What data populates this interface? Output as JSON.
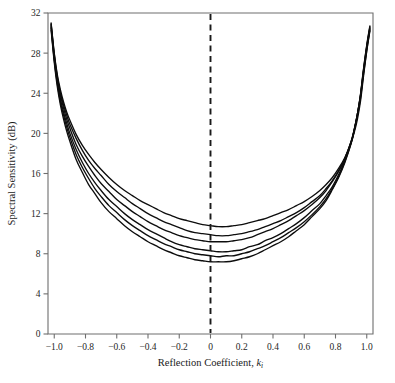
{
  "chart_data": {
    "type": "line",
    "title": "",
    "subtitle": "",
    "xlabel": "Reflection Coefficient, k",
    "xlabel_sub": "i",
    "ylabel": "Spectral Sensitivity (dB)",
    "xlim": [
      -1.04,
      1.04
    ],
    "ylim": [
      0,
      32
    ],
    "xticks": [
      -1.0,
      -0.8,
      -0.6,
      -0.4,
      -0.2,
      0,
      0.2,
      0.4,
      0.6,
      0.8,
      1.0
    ],
    "xticklabels": [
      "-1.0",
      "-0.8",
      "-0.6",
      "-0.4",
      "-0.2",
      "0",
      "0.2",
      "0.4",
      "0.6",
      "0.8",
      "1.0"
    ],
    "yticks": [
      0,
      4,
      8,
      12,
      16,
      20,
      24,
      28,
      32
    ],
    "yticklabels": [
      "0",
      "4",
      "8",
      "12",
      "16",
      "20",
      "24",
      "28",
      "32"
    ],
    "grid": false,
    "legend": "none",
    "annotations": [
      {
        "name": "zero-reference-line",
        "type": "vline",
        "x": 0,
        "style": "dashed"
      }
    ],
    "x": [
      -1.02,
      -1.0,
      -0.98,
      -0.96,
      -0.94,
      -0.92,
      -0.9,
      -0.86,
      -0.82,
      -0.78,
      -0.74,
      -0.7,
      -0.65,
      -0.6,
      -0.55,
      -0.5,
      -0.45,
      -0.4,
      -0.35,
      -0.3,
      -0.25,
      -0.2,
      -0.15,
      -0.1,
      -0.05,
      0,
      0.05,
      0.1,
      0.15,
      0.2,
      0.25,
      0.3,
      0.35,
      0.4,
      0.45,
      0.5,
      0.55,
      0.6,
      0.65,
      0.7,
      0.74,
      0.78,
      0.82,
      0.86,
      0.9,
      0.92,
      0.94,
      0.96,
      0.98,
      1.0,
      1.02
    ],
    "series": [
      {
        "name": "curve-1",
        "values": [
          31.0,
          28.0,
          25.8,
          24.3,
          23.1,
          22.1,
          21.3,
          19.9,
          18.8,
          17.9,
          17.1,
          16.4,
          15.6,
          14.9,
          14.3,
          13.8,
          13.3,
          12.9,
          12.5,
          12.1,
          11.8,
          11.5,
          11.3,
          11.1,
          10.9,
          10.8,
          10.7,
          10.7,
          10.8,
          10.9,
          11.1,
          11.3,
          11.5,
          11.8,
          12.1,
          12.4,
          12.8,
          13.2,
          13.7,
          14.3,
          14.9,
          15.6,
          16.5,
          17.6,
          19.1,
          20.1,
          21.4,
          23.2,
          25.8,
          28.2,
          30.2
        ]
      },
      {
        "name": "curve-2",
        "values": [
          30.9,
          27.9,
          25.6,
          24.0,
          22.8,
          21.8,
          20.9,
          19.5,
          18.3,
          17.3,
          16.5,
          15.8,
          14.9,
          14.2,
          13.6,
          13.0,
          12.5,
          12.0,
          11.6,
          11.2,
          10.9,
          10.6,
          10.3,
          10.1,
          10.0,
          9.9,
          9.8,
          9.8,
          9.9,
          10.0,
          10.2,
          10.4,
          10.7,
          11.0,
          11.3,
          11.7,
          12.1,
          12.6,
          13.2,
          13.8,
          14.5,
          15.3,
          16.3,
          17.5,
          19.2,
          20.3,
          21.7,
          23.5,
          26.0,
          28.3,
          30.3
        ]
      },
      {
        "name": "curve-3",
        "values": [
          30.8,
          27.7,
          25.4,
          23.8,
          22.5,
          21.4,
          20.5,
          18.9,
          17.7,
          16.7,
          15.8,
          15.0,
          14.2,
          13.4,
          12.8,
          12.2,
          11.7,
          11.2,
          10.8,
          10.4,
          10.1,
          9.8,
          9.6,
          9.4,
          9.3,
          9.2,
          9.2,
          9.2,
          9.3,
          9.4,
          9.6,
          9.9,
          10.2,
          10.5,
          10.9,
          11.3,
          11.8,
          12.3,
          12.9,
          13.6,
          14.3,
          15.2,
          16.2,
          17.5,
          19.2,
          20.4,
          21.9,
          23.7,
          26.2,
          28.5,
          30.4
        ]
      },
      {
        "name": "curve-4",
        "values": [
          30.6,
          27.5,
          25.1,
          23.4,
          22.1,
          21.0,
          20.0,
          18.4,
          17.1,
          16.0,
          15.1,
          14.3,
          13.4,
          12.7,
          12.0,
          11.4,
          10.9,
          10.4,
          10.0,
          9.6,
          9.2,
          8.9,
          8.7,
          8.5,
          8.4,
          8.3,
          8.2,
          8.2,
          8.3,
          8.4,
          8.7,
          8.9,
          9.3,
          9.6,
          10.0,
          10.5,
          11.0,
          11.6,
          12.3,
          13.0,
          13.8,
          14.7,
          15.9,
          17.3,
          19.1,
          20.4,
          21.9,
          23.8,
          26.3,
          28.6,
          30.5
        ]
      },
      {
        "name": "curve-5",
        "values": [
          30.5,
          27.3,
          24.9,
          23.1,
          21.8,
          20.6,
          19.6,
          17.9,
          16.6,
          15.5,
          14.5,
          13.7,
          12.8,
          12.1,
          11.4,
          10.8,
          10.3,
          9.8,
          9.4,
          9.0,
          8.7,
          8.4,
          8.2,
          8.0,
          7.9,
          7.8,
          7.7,
          7.8,
          7.8,
          8.0,
          8.2,
          8.5,
          8.8,
          9.2,
          9.6,
          10.1,
          10.6,
          11.2,
          11.9,
          12.7,
          13.5,
          14.5,
          15.7,
          17.2,
          19.0,
          20.3,
          21.9,
          23.8,
          26.4,
          28.7,
          30.6
        ]
      },
      {
        "name": "curve-6",
        "values": [
          30.3,
          27.1,
          24.6,
          22.8,
          21.4,
          20.2,
          19.2,
          17.4,
          16.1,
          14.9,
          14.0,
          13.1,
          12.2,
          11.5,
          10.8,
          10.2,
          9.7,
          9.2,
          8.8,
          8.4,
          8.1,
          7.8,
          7.6,
          7.4,
          7.3,
          7.2,
          7.2,
          7.2,
          7.3,
          7.5,
          7.7,
          8.0,
          8.4,
          8.8,
          9.2,
          9.7,
          10.3,
          10.9,
          11.7,
          12.5,
          13.3,
          14.4,
          15.6,
          17.1,
          19.0,
          20.3,
          21.9,
          23.9,
          26.5,
          28.8,
          30.7
        ]
      }
    ]
  }
}
